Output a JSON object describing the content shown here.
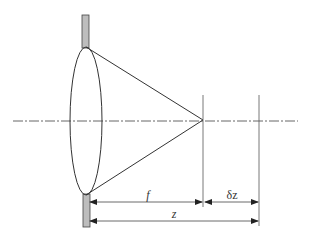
{
  "diagram": {
    "title": "",
    "elements": [
      "lens",
      "aperture-stop-top",
      "aperture-stop-bottom",
      "optical-axis",
      "converging-rays",
      "focal-plane-line",
      "displaced-plane-line"
    ],
    "labels": {
      "focal_length": "f",
      "distance": "z",
      "defocus": "δz"
    },
    "colors": {
      "line": "#333333",
      "stop_fill": "#bdbdbd",
      "axis": "#555555"
    }
  }
}
